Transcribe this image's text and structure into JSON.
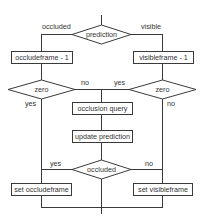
{
  "diagram": {
    "type": "flowchart",
    "nodes": {
      "prediction": {
        "label": "prediction",
        "shape": "diamond"
      },
      "occludeframe_dec": {
        "label": "occludeframe - 1",
        "shape": "box"
      },
      "visibleframe_dec": {
        "label": "visibleframe - 1",
        "shape": "box"
      },
      "zero_left": {
        "label": "zero",
        "shape": "diamond"
      },
      "zero_right": {
        "label": "zero",
        "shape": "diamond"
      },
      "occlusion_query": {
        "label": "occlusion query",
        "shape": "box"
      },
      "update_prediction": {
        "label": "update prediction",
        "shape": "box"
      },
      "occluded": {
        "label": "occluded",
        "shape": "diamond"
      },
      "set_occludeframe": {
        "label": "set occludeframe",
        "shape": "box"
      },
      "set_visibleframe": {
        "label": "set visibleframe",
        "shape": "box"
      }
    },
    "edge_labels": {
      "prediction_occluded": "occluded",
      "prediction_visible": "visible",
      "zero_left_yes": "yes",
      "zero_left_no": "no",
      "zero_right_yes": "yes",
      "zero_right_no": "no",
      "occluded_yes": "yes",
      "occluded_no": "no"
    },
    "colors": {
      "stroke": "#3a3a3a",
      "text": "#333333",
      "background": "#ffffff"
    }
  }
}
